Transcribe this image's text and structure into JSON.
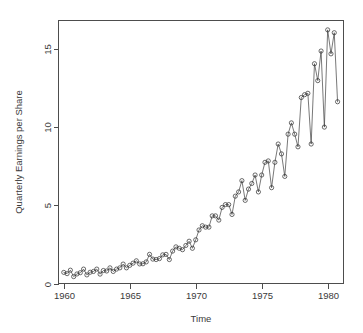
{
  "chart_data": {
    "type": "line",
    "title": "",
    "subtitle": "",
    "xlabel": "Time",
    "ylabel": "Quarterly Earnings per Share",
    "grid": false,
    "legend": false,
    "legend_position": "none",
    "marker": "open-circle",
    "line_color": "#3d3d3d",
    "marker_color": "#2e2e2e",
    "xlim": [
      1959.6,
      1981.2
    ],
    "ylim": [
      0,
      16.8
    ],
    "xticks": [
      1960,
      1965,
      1970,
      1975,
      1980
    ],
    "xtick_labels": [
      "1960",
      "1965",
      "1970",
      "1975",
      "1980"
    ],
    "yticks": [
      0,
      5,
      10,
      15
    ],
    "ytick_labels": [
      "0",
      "5",
      "10",
      "15"
    ],
    "x": [
      1960.0,
      1960.25,
      1960.5,
      1960.75,
      1961.0,
      1961.25,
      1961.5,
      1961.75,
      1962.0,
      1962.25,
      1962.5,
      1962.75,
      1963.0,
      1963.25,
      1963.5,
      1963.75,
      1964.0,
      1964.25,
      1964.5,
      1964.75,
      1965.0,
      1965.25,
      1965.5,
      1965.75,
      1966.0,
      1966.25,
      1966.5,
      1966.75,
      1967.0,
      1967.25,
      1967.5,
      1967.75,
      1968.0,
      1968.25,
      1968.5,
      1968.75,
      1969.0,
      1969.25,
      1969.5,
      1969.75,
      1970.0,
      1970.25,
      1970.5,
      1970.75,
      1971.0,
      1971.25,
      1971.5,
      1971.75,
      1972.0,
      1972.25,
      1972.5,
      1972.75,
      1973.0,
      1973.25,
      1973.5,
      1973.75,
      1974.0,
      1974.25,
      1974.5,
      1974.75,
      1975.0,
      1975.25,
      1975.5,
      1975.75,
      1976.0,
      1976.25,
      1976.5,
      1976.75,
      1977.0,
      1977.25,
      1977.5,
      1977.75,
      1978.0,
      1978.25,
      1978.5,
      1978.75,
      1979.0,
      1979.25,
      1979.5,
      1979.75,
      1980.0,
      1980.25,
      1980.5,
      1980.75
    ],
    "values": [
      0.71,
      0.63,
      0.85,
      0.44,
      0.61,
      0.69,
      0.92,
      0.55,
      0.72,
      0.77,
      0.92,
      0.6,
      0.83,
      0.8,
      1.0,
      0.77,
      0.92,
      1.0,
      1.24,
      1.0,
      1.16,
      1.3,
      1.45,
      1.25,
      1.26,
      1.38,
      1.86,
      1.56,
      1.53,
      1.59,
      1.83,
      1.86,
      1.53,
      2.07,
      2.34,
      2.25,
      2.16,
      2.43,
      2.7,
      2.25,
      2.79,
      3.42,
      3.69,
      3.6,
      3.6,
      4.32,
      4.32,
      4.05,
      4.86,
      5.04,
      5.04,
      4.41,
      5.58,
      5.85,
      6.57,
      5.31,
      6.03,
      6.39,
      6.93,
      5.85,
      6.93,
      7.74,
      7.83,
      6.12,
      7.74,
      8.91,
      8.28,
      6.84,
      9.54,
      10.26,
      9.54,
      8.73,
      11.88,
      12.06,
      12.15,
      8.91,
      14.04,
      12.96,
      14.85,
      9.99,
      16.2,
      14.67,
      16.02,
      11.61
    ],
    "n_points": 84,
    "series_name": "Johnson & Johnson quarterly earnings per share"
  }
}
